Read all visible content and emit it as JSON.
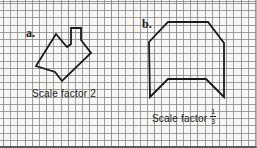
{
  "figure": {
    "background": "#f7f7f4",
    "grid_color": "#828282",
    "grid_cell_px": 7.2,
    "stroke_color": "#1b1b1b"
  },
  "panel_a": {
    "label": "a.",
    "caption": "Scale factor 2",
    "polygon": [
      [
        56,
        34
      ],
      [
        67,
        47
      ],
      [
        71,
        44
      ],
      [
        71,
        28
      ],
      [
        81,
        28
      ],
      [
        81,
        40
      ],
      [
        91,
        53
      ],
      [
        62,
        81
      ],
      [
        55,
        72
      ],
      [
        36,
        66
      ]
    ]
  },
  "panel_b": {
    "label": "b.",
    "caption_prefix": "Scale factor",
    "fraction": {
      "numerator": "1",
      "denominator": "3"
    },
    "polygon": [
      [
        168,
        22
      ],
      [
        208,
        22
      ],
      [
        224,
        43
      ],
      [
        224,
        97
      ],
      [
        206,
        79
      ],
      [
        168,
        79
      ],
      [
        150,
        97
      ],
      [
        149,
        42
      ]
    ]
  }
}
